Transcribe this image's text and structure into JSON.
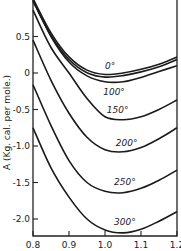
{
  "chart_data": {
    "type": "line",
    "title": "",
    "xlabel": "",
    "ylabel": "A (Kg. cal. per mole.)",
    "xlim": [
      0.8,
      1.2
    ],
    "ylim": [
      -2.23,
      1.0
    ],
    "grid": false,
    "legend": "inline curve labels",
    "x_ticks": [
      0.8,
      0.9,
      1.0,
      1.1,
      1.2
    ],
    "x_tick_labels": [
      "0.8",
      "0.9",
      "1.0",
      "1.1",
      "1.2"
    ],
    "y_ticks": [
      0.5,
      0,
      -0.5,
      -1.0,
      -1.5,
      -2.0
    ],
    "y_tick_labels": [
      "0.5",
      "0",
      "-0.5",
      "-1.0",
      "-1.5",
      "-2.0"
    ],
    "x": [
      0.8,
      0.85,
      0.9,
      0.95,
      1.0,
      1.05,
      1.1,
      1.15,
      1.2
    ],
    "series": [
      {
        "name": "0°",
        "values": [
          1.02,
          0.55,
          0.22,
          0.04,
          -0.02,
          0.0,
          0.05,
          0.12,
          0.22
        ],
        "label_pos": [
          1.0,
          0.06
        ]
      },
      {
        "name": "100°",
        "values": [
          1.0,
          0.5,
          0.15,
          -0.04,
          -0.12,
          -0.12,
          -0.06,
          0.02,
          0.1
        ],
        "label_pos": [
          0.995,
          -0.3
        ]
      },
      {
        "name": "150°",
        "values": [
          0.86,
          0.35,
          0.0,
          -0.35,
          -0.6,
          -0.64,
          -0.6,
          -0.5,
          -0.37
        ],
        "label_pos": [
          1.005,
          -0.55
        ]
      },
      {
        "name": "200°",
        "values": [
          0.45,
          -0.1,
          -0.55,
          -0.88,
          -1.05,
          -1.08,
          -1.02,
          -0.9,
          -0.75
        ],
        "label_pos": [
          1.03,
          -1.0
        ]
      },
      {
        "name": "250°",
        "values": [
          -0.16,
          -0.72,
          -1.2,
          -1.5,
          -1.62,
          -1.64,
          -1.58,
          -1.47,
          -1.33
        ],
        "label_pos": [
          1.025,
          -1.53
        ]
      },
      {
        "name": "300°",
        "values": [
          -0.75,
          -1.3,
          -1.7,
          -2.0,
          -2.15,
          -2.19,
          -2.14,
          -2.03,
          -1.9
        ],
        "label_pos": [
          1.025,
          -2.08
        ]
      }
    ]
  }
}
